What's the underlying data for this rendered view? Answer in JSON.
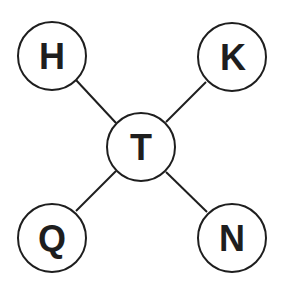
{
  "diagram": {
    "type": "star-graph",
    "center": {
      "label": "T",
      "x": 141,
      "y": 147
    },
    "nodes": [
      {
        "id": "H",
        "label": "H",
        "x": 52,
        "y": 56
      },
      {
        "id": "K",
        "label": "K",
        "x": 232,
        "y": 57
      },
      {
        "id": "Q",
        "label": "Q",
        "x": 52,
        "y": 238
      },
      {
        "id": "N",
        "label": "N",
        "x": 232,
        "y": 238
      }
    ],
    "edges": [
      [
        "T",
        "H"
      ],
      [
        "T",
        "K"
      ],
      [
        "T",
        "Q"
      ],
      [
        "T",
        "N"
      ]
    ],
    "radius": 34,
    "stroke_color": "#1e1e1e",
    "fill_color": "#ffffff"
  }
}
